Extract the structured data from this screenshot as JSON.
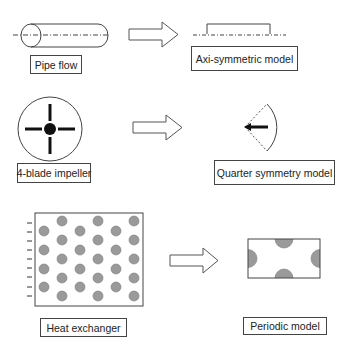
{
  "diagram": {
    "rows": [
      {
        "source": {
          "label": "Pipe flow",
          "shape": "cylinder-with-axis"
        },
        "arrow": "hollow-right-arrow",
        "target": {
          "label": "Axi-symmetric model",
          "shape": "half-section-bracket-on-axis"
        }
      },
      {
        "source": {
          "label": "4-blade impeller",
          "shape": "circle-with-four-blades"
        },
        "arrow": "hollow-right-arrow",
        "target": {
          "label": "Quarter symmetry model",
          "shape": "quarter-sector-with-one-blade"
        }
      },
      {
        "source": {
          "label": "Heat exchanger",
          "shape": "tube-bank-staggered-array"
        },
        "arrow": "hollow-right-arrow",
        "target": {
          "label": "Periodic model",
          "shape": "periodic-cell-with-half-tubes"
        }
      }
    ],
    "colors": {
      "line": "#444444",
      "tube_fill": "#9a9a9a",
      "background": "#ffffff"
    }
  }
}
